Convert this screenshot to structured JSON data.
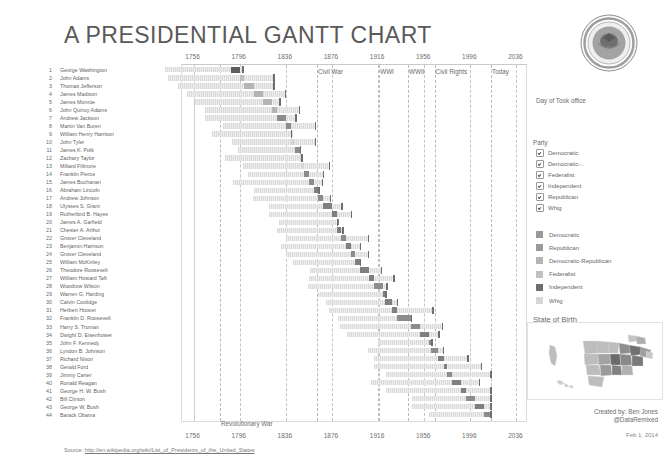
{
  "title": "A PRESIDENTIAL GANTT CHART",
  "seal_name": "presidential-seal",
  "axis": {
    "ticks": [
      "1756",
      "1796",
      "1836",
      "1876",
      "1916",
      "1956",
      "1996",
      "2036"
    ],
    "x_min": 1746,
    "x_max": 2046
  },
  "eras": [
    {
      "label": "Civil War",
      "year": 1863
    },
    {
      "label": "WWI",
      "year": 1917
    },
    {
      "label": "WWII",
      "year": 1942
    },
    {
      "label": "Civil Rights",
      "year": 1965
    },
    {
      "label": "Today",
      "year": 2014
    },
    {
      "label": "Revolutionary War",
      "year": 1779
    }
  ],
  "panel": {
    "measure_label": "Day of Took office",
    "party_title": "Party",
    "party_filters": [
      {
        "label": "Democratic",
        "checked": true
      },
      {
        "label": "Democratic-..",
        "checked": true
      },
      {
        "label": "Federalist",
        "checked": true
      },
      {
        "label": "Independent",
        "checked": true
      },
      {
        "label": "Republican",
        "checked": true
      },
      {
        "label": "Whig",
        "checked": true
      }
    ],
    "party_swatches": [
      {
        "label": "Democratic",
        "color": "#9a9a9a"
      },
      {
        "label": "Republican",
        "color": "#9a9a9a"
      },
      {
        "label": "Democratic-Republican",
        "color": "#b4b4b4"
      },
      {
        "label": "Federalist",
        "color": "#c0c0c0"
      },
      {
        "label": "Independent",
        "color": "#6f6f6f"
      },
      {
        "label": "Whig",
        "color": "#d6d6d6"
      }
    ],
    "state_of_birth_title": "State of Birth",
    "map_name": "us-state-of-birth-map"
  },
  "credit_line1": "Created by: Ben Jones",
  "credit_line2": "@DataRemixed",
  "datestamp": "Feb 1, 2014",
  "source_prefix": "Source:",
  "source_url": "http://en.wikipedia.org/wiki/List_of_Presidents_of_the_United_States",
  "chart_data": {
    "type": "bar",
    "title": "A Presidential Gantt Chart",
    "xlabel": "",
    "ylabel": "",
    "xlim": [
      1746,
      2046
    ],
    "grid": true,
    "legend_position": "right",
    "categories": [
      "George Washington",
      "John Adams",
      "Thomas Jefferson",
      "James Madison",
      "James Monroe",
      "John Quincy Adams",
      "Andrew Jackson",
      "Martin Van Buren",
      "William Henry Harrison",
      "John Tyler",
      "James K. Polk",
      "Zachary Taylor",
      "Millard Fillmore",
      "Franklin Pierce",
      "James Buchanan",
      "Abraham Lincoln",
      "Andrew Johnson",
      "Ulysses S. Grant",
      "Rutherford B. Hayes",
      "James A. Garfield",
      "Chester A. Arthur",
      "Grover Cleveland",
      "Benjamin Harrison",
      "Grover Cleveland",
      "William McKinley",
      "Theodore Roosevelt",
      "William Howard Taft",
      "Woodrow Wilson",
      "Warren G. Harding",
      "Calvin Coolidge",
      "Herbert Hoover",
      "Franklin D. Roosevelt",
      "Harry S. Truman",
      "Dwight D. Eisenhower",
      "John F. Kennedy",
      "Lyndon B. Johnson",
      "Richard Nixon",
      "Gerald Ford",
      "Jimmy Carter",
      "Ronald Reagan",
      "George H. W. Bush",
      "Bill Clinton",
      "George W. Bush",
      "Barack Obama"
    ],
    "series_note": "Each row: light bar = lifespan (born to death), dark segment = term in office, tick mark = year of death.",
    "rows": [
      {
        "n": 1,
        "name": "George Washington",
        "party": "Independent",
        "born": 1732,
        "died": 1799,
        "term_start": 1789,
        "term_end": 1797
      },
      {
        "n": 2,
        "name": "John Adams",
        "party": "Federalist",
        "born": 1735,
        "died": 1826,
        "term_start": 1797,
        "term_end": 1801
      },
      {
        "n": 3,
        "name": "Thomas Jefferson",
        "party": "Democratic-Republican",
        "born": 1743,
        "died": 1826,
        "term_start": 1801,
        "term_end": 1809
      },
      {
        "n": 4,
        "name": "James Madison",
        "party": "Democratic-Republican",
        "born": 1751,
        "died": 1836,
        "term_start": 1809,
        "term_end": 1817
      },
      {
        "n": 5,
        "name": "James Monroe",
        "party": "Democratic-Republican",
        "born": 1758,
        "died": 1831,
        "term_start": 1817,
        "term_end": 1825
      },
      {
        "n": 6,
        "name": "John Quincy Adams",
        "party": "Democratic-Republican",
        "born": 1767,
        "died": 1848,
        "term_start": 1825,
        "term_end": 1829
      },
      {
        "n": 7,
        "name": "Andrew Jackson",
        "party": "Democratic",
        "born": 1767,
        "died": 1845,
        "term_start": 1829,
        "term_end": 1837
      },
      {
        "n": 8,
        "name": "Martin Van Buren",
        "party": "Democratic",
        "born": 1782,
        "died": 1862,
        "term_start": 1837,
        "term_end": 1841
      },
      {
        "n": 9,
        "name": "William Henry Harrison",
        "party": "Whig",
        "born": 1773,
        "died": 1841,
        "term_start": 1841,
        "term_end": 1841
      },
      {
        "n": 10,
        "name": "John Tyler",
        "party": "Whig",
        "born": 1790,
        "died": 1862,
        "term_start": 1841,
        "term_end": 1845
      },
      {
        "n": 11,
        "name": "James K. Polk",
        "party": "Democratic",
        "born": 1795,
        "died": 1849,
        "term_start": 1845,
        "term_end": 1849
      },
      {
        "n": 12,
        "name": "Zachary Taylor",
        "party": "Whig",
        "born": 1784,
        "died": 1850,
        "term_start": 1849,
        "term_end": 1850
      },
      {
        "n": 13,
        "name": "Millard Fillmore",
        "party": "Whig",
        "born": 1800,
        "died": 1874,
        "term_start": 1850,
        "term_end": 1853
      },
      {
        "n": 14,
        "name": "Franklin Pierce",
        "party": "Democratic",
        "born": 1804,
        "died": 1869,
        "term_start": 1853,
        "term_end": 1857
      },
      {
        "n": 15,
        "name": "James Buchanan",
        "party": "Democratic",
        "born": 1791,
        "died": 1868,
        "term_start": 1857,
        "term_end": 1861
      },
      {
        "n": 16,
        "name": "Abraham Lincoln",
        "party": "Republican",
        "born": 1809,
        "died": 1865,
        "term_start": 1861,
        "term_end": 1865
      },
      {
        "n": 17,
        "name": "Andrew Johnson",
        "party": "Democratic",
        "born": 1808,
        "died": 1875,
        "term_start": 1865,
        "term_end": 1869
      },
      {
        "n": 18,
        "name": "Ulysses S. Grant",
        "party": "Republican",
        "born": 1822,
        "died": 1885,
        "term_start": 1869,
        "term_end": 1877
      },
      {
        "n": 19,
        "name": "Rutherford B. Hayes",
        "party": "Republican",
        "born": 1822,
        "died": 1893,
        "term_start": 1877,
        "term_end": 1881
      },
      {
        "n": 20,
        "name": "James A. Garfield",
        "party": "Republican",
        "born": 1831,
        "died": 1881,
        "term_start": 1881,
        "term_end": 1881
      },
      {
        "n": 21,
        "name": "Chester A. Arthur",
        "party": "Republican",
        "born": 1829,
        "died": 1886,
        "term_start": 1881,
        "term_end": 1885
      },
      {
        "n": 22,
        "name": "Grover Cleveland",
        "party": "Democratic",
        "born": 1837,
        "died": 1908,
        "term_start": 1885,
        "term_end": 1889
      },
      {
        "n": 23,
        "name": "Benjamin Harrison",
        "party": "Republican",
        "born": 1833,
        "died": 1901,
        "term_start": 1889,
        "term_end": 1893
      },
      {
        "n": 24,
        "name": "Grover Cleveland",
        "party": "Democratic",
        "born": 1837,
        "died": 1908,
        "term_start": 1893,
        "term_end": 1897
      },
      {
        "n": 25,
        "name": "William McKinley",
        "party": "Republican",
        "born": 1843,
        "died": 1901,
        "term_start": 1897,
        "term_end": 1901
      },
      {
        "n": 26,
        "name": "Theodore Roosevelt",
        "party": "Republican",
        "born": 1858,
        "died": 1919,
        "term_start": 1901,
        "term_end": 1909
      },
      {
        "n": 27,
        "name": "William Howard Taft",
        "party": "Republican",
        "born": 1857,
        "died": 1930,
        "term_start": 1909,
        "term_end": 1913
      },
      {
        "n": 28,
        "name": "Woodrow Wilson",
        "party": "Democratic",
        "born": 1856,
        "died": 1924,
        "term_start": 1913,
        "term_end": 1921
      },
      {
        "n": 29,
        "name": "Warren G. Harding",
        "party": "Republican",
        "born": 1865,
        "died": 1923,
        "term_start": 1921,
        "term_end": 1923
      },
      {
        "n": 30,
        "name": "Calvin Coolidge",
        "party": "Republican",
        "born": 1872,
        "died": 1933,
        "term_start": 1923,
        "term_end": 1929
      },
      {
        "n": 31,
        "name": "Herbert Hoover",
        "party": "Republican",
        "born": 1874,
        "died": 1964,
        "term_start": 1929,
        "term_end": 1933
      },
      {
        "n": 32,
        "name": "Franklin D. Roosevelt",
        "party": "Democratic",
        "born": 1882,
        "died": 1945,
        "term_start": 1933,
        "term_end": 1945
      },
      {
        "n": 33,
        "name": "Harry S. Truman",
        "party": "Democratic",
        "born": 1884,
        "died": 1972,
        "term_start": 1945,
        "term_end": 1953
      },
      {
        "n": 34,
        "name": "Dwight D. Eisenhower",
        "party": "Republican",
        "born": 1890,
        "died": 1969,
        "term_start": 1953,
        "term_end": 1961
      },
      {
        "n": 35,
        "name": "John F. Kennedy",
        "party": "Democratic",
        "born": 1917,
        "died": 1963,
        "term_start": 1961,
        "term_end": 1963
      },
      {
        "n": 36,
        "name": "Lyndon B. Johnson",
        "party": "Democratic",
        "born": 1908,
        "died": 1973,
        "term_start": 1963,
        "term_end": 1969
      },
      {
        "n": 37,
        "name": "Richard Nixon",
        "party": "Republican",
        "born": 1913,
        "died": 1994,
        "term_start": 1969,
        "term_end": 1974
      },
      {
        "n": 38,
        "name": "Gerald Ford",
        "party": "Republican",
        "born": 1913,
        "died": 2006,
        "term_start": 1974,
        "term_end": 1977
      },
      {
        "n": 39,
        "name": "Jimmy Carter",
        "party": "Democratic",
        "born": 1924,
        "died": 2014,
        "term_start": 1977,
        "term_end": 1981
      },
      {
        "n": 40,
        "name": "Ronald Reagan",
        "party": "Republican",
        "born": 1911,
        "died": 2004,
        "term_start": 1981,
        "term_end": 1989
      },
      {
        "n": 41,
        "name": "George H. W. Bush",
        "party": "Republican",
        "born": 1924,
        "died": 2014,
        "term_start": 1989,
        "term_end": 1993
      },
      {
        "n": 42,
        "name": "Bill Clinton",
        "party": "Democratic",
        "born": 1946,
        "died": 2014,
        "term_start": 1993,
        "term_end": 2001
      },
      {
        "n": 43,
        "name": "George W. Bush",
        "party": "Republican",
        "born": 1946,
        "died": 2014,
        "term_start": 2001,
        "term_end": 2009
      },
      {
        "n": 44,
        "name": "Barack Obama",
        "party": "Democratic",
        "born": 1961,
        "died": 2014,
        "term_start": 2009,
        "term_end": 2014
      }
    ]
  }
}
